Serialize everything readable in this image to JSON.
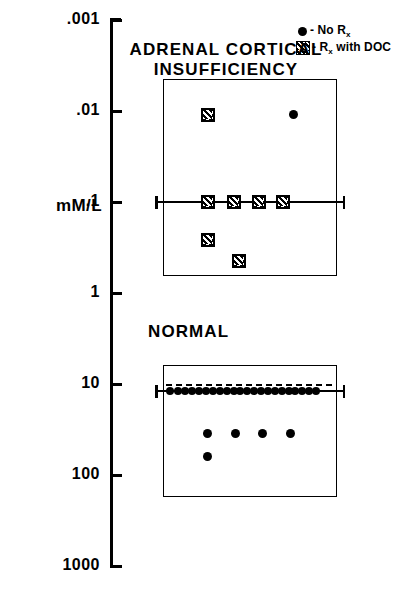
{
  "chart_data": {
    "type": "scatter",
    "title": "",
    "ylabel": "mM/L",
    "xlabel": "",
    "yscale": "log",
    "ylim": [
      0.001,
      1000
    ],
    "grid": false,
    "ytick_labels": [
      ".001",
      ".01",
      ".1",
      "1",
      "10",
      "100",
      "1000"
    ],
    "ytick_values": [
      0.001,
      0.01,
      0.1,
      1,
      10,
      100,
      1000
    ],
    "legend_position": "top-right",
    "legend": [
      {
        "key": "no-rx",
        "marker": "filled-circle",
        "label": "- No R",
        "label_sub": "x"
      },
      {
        "key": "rx-doc",
        "marker": "hatched-square",
        "label": "- R",
        "label_sub": "x",
        "label_tail": " with DOC"
      }
    ],
    "groups": [
      {
        "name": "ADRENAL CORTICAL\nINSUFFICIENCY",
        "title_line1": "ADRENAL CORTICAL",
        "title_line2": "INSUFFICIENCY",
        "mean_value": 0.1,
        "mean_line": true,
        "dashed_reference": false,
        "box": {
          "y_top": 0.0045,
          "y_bottom": 0.62
        },
        "points": [
          {
            "value": 0.011,
            "marker": "hatched-square",
            "x_frac": 0.26
          },
          {
            "value": 0.011,
            "marker": "filled-circle",
            "x_frac": 0.76
          },
          {
            "value": 0.1,
            "marker": "hatched-square",
            "x_frac": 0.26
          },
          {
            "value": 0.1,
            "marker": "hatched-square",
            "x_frac": 0.41
          },
          {
            "value": 0.1,
            "marker": "hatched-square",
            "x_frac": 0.56
          },
          {
            "value": 0.1,
            "marker": "hatched-square",
            "x_frac": 0.7
          },
          {
            "value": 0.26,
            "marker": "hatched-square",
            "x_frac": 0.26
          },
          {
            "value": 0.45,
            "marker": "hatched-square",
            "x_frac": 0.44
          }
        ]
      },
      {
        "name": "NORMAL",
        "title_line1": "NORMAL",
        "title_line2": "",
        "mean_value": 12.0,
        "mean_line": true,
        "dashed_reference": true,
        "dashed_value": 10.0,
        "box": {
          "y_top": 6.2,
          "y_bottom": 165
        },
        "points": [
          {
            "value": 12.0,
            "marker": "filled-circle",
            "x_frac": 0.04
          },
          {
            "value": 12.0,
            "marker": "filled-circle",
            "x_frac": 0.09
          },
          {
            "value": 12.0,
            "marker": "filled-circle",
            "x_frac": 0.13
          },
          {
            "value": 12.0,
            "marker": "filled-circle",
            "x_frac": 0.17
          },
          {
            "value": 12.0,
            "marker": "filled-circle",
            "x_frac": 0.21
          },
          {
            "value": 12.0,
            "marker": "filled-circle",
            "x_frac": 0.25
          },
          {
            "value": 12.0,
            "marker": "filled-circle",
            "x_frac": 0.29
          },
          {
            "value": 12.0,
            "marker": "filled-circle",
            "x_frac": 0.33
          },
          {
            "value": 12.0,
            "marker": "filled-circle",
            "x_frac": 0.37
          },
          {
            "value": 12.0,
            "marker": "filled-circle",
            "x_frac": 0.41
          },
          {
            "value": 12.0,
            "marker": "filled-circle",
            "x_frac": 0.45
          },
          {
            "value": 12.0,
            "marker": "filled-circle",
            "x_frac": 0.49
          },
          {
            "value": 12.0,
            "marker": "filled-circle",
            "x_frac": 0.53
          },
          {
            "value": 12.0,
            "marker": "filled-circle",
            "x_frac": 0.57
          },
          {
            "value": 12.0,
            "marker": "filled-circle",
            "x_frac": 0.61
          },
          {
            "value": 12.0,
            "marker": "filled-circle",
            "x_frac": 0.65
          },
          {
            "value": 12.0,
            "marker": "filled-circle",
            "x_frac": 0.69
          },
          {
            "value": 12.0,
            "marker": "filled-circle",
            "x_frac": 0.73
          },
          {
            "value": 12.0,
            "marker": "filled-circle",
            "x_frac": 0.77
          },
          {
            "value": 12.0,
            "marker": "filled-circle",
            "x_frac": 0.81
          },
          {
            "value": 12.0,
            "marker": "filled-circle",
            "x_frac": 0.85
          },
          {
            "value": 12.0,
            "marker": "filled-circle",
            "x_frac": 0.89
          },
          {
            "value": 35.0,
            "marker": "filled-circle",
            "x_frac": 0.26
          },
          {
            "value": 35.0,
            "marker": "filled-circle",
            "x_frac": 0.42
          },
          {
            "value": 35.0,
            "marker": "filled-circle",
            "x_frac": 0.58
          },
          {
            "value": 35.0,
            "marker": "filled-circle",
            "x_frac": 0.74
          },
          {
            "value": 62.0,
            "marker": "filled-circle",
            "x_frac": 0.26
          }
        ]
      }
    ]
  }
}
